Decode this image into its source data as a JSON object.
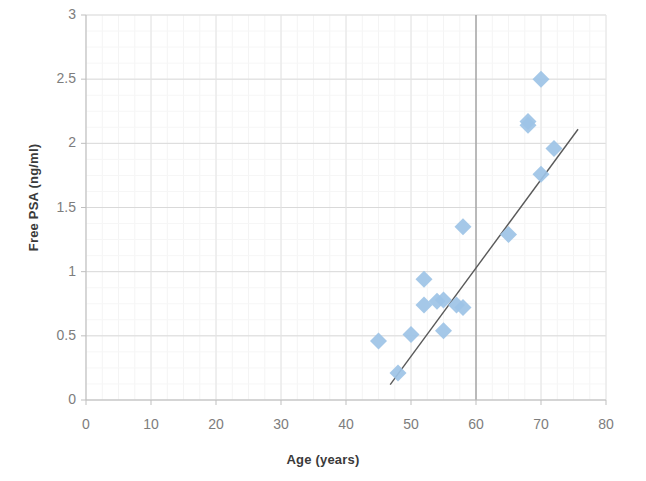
{
  "chart_data": {
    "type": "scatter",
    "title": "",
    "xlabel": "Age (years)",
    "ylabel": "Free PSA (ng/ml)",
    "xlim": [
      0,
      80
    ],
    "ylim": [
      0,
      3
    ],
    "xticks": [
      0,
      10,
      20,
      30,
      40,
      50,
      60,
      70,
      80
    ],
    "yticks": [
      0,
      0.5,
      1,
      1.5,
      2,
      2.5,
      3
    ],
    "xtick_labels": [
      "0",
      "10",
      "20",
      "30",
      "40",
      "50",
      "60",
      "70",
      "80"
    ],
    "ytick_labels": [
      "0",
      "0.5",
      "1",
      "1.5",
      "2",
      "2.5",
      "3"
    ],
    "grid": true,
    "legend": false,
    "marker_shape": "diamond",
    "marker_color": "#9dc3e6",
    "trendline_color": "#595959",
    "points": [
      {
        "x": 45,
        "y": 0.46
      },
      {
        "x": 48,
        "y": 0.21
      },
      {
        "x": 50,
        "y": 0.51
      },
      {
        "x": 52,
        "y": 0.94
      },
      {
        "x": 52,
        "y": 0.74
      },
      {
        "x": 54,
        "y": 0.77
      },
      {
        "x": 55,
        "y": 0.78
      },
      {
        "x": 55,
        "y": 0.54
      },
      {
        "x": 57,
        "y": 0.74
      },
      {
        "x": 58,
        "y": 0.72
      },
      {
        "x": 58,
        "y": 1.35
      },
      {
        "x": 65,
        "y": 1.29
      },
      {
        "x": 68,
        "y": 2.17
      },
      {
        "x": 68,
        "y": 2.14
      },
      {
        "x": 70,
        "y": 2.5
      },
      {
        "x": 70,
        "y": 1.76
      },
      {
        "x": 72,
        "y": 1.96
      }
    ],
    "trendline": {
      "x0": 46.8,
      "y0": 0.12,
      "x1": 75.7,
      "y1": 2.11
    }
  }
}
